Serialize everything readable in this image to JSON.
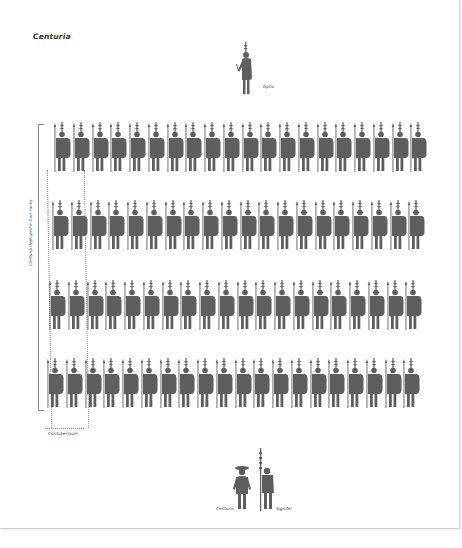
{
  "title": "Centuria",
  "colors": {
    "figure": "#5e5e5e",
    "line": "#888888",
    "text": "#333333"
  },
  "officers": {
    "optio": {
      "label": "Optio",
      "icon": "optio-soldier-icon"
    },
    "centurio": {
      "label": "Centurio",
      "icon": "centurion-icon"
    },
    "signifer": {
      "label": "Signifer",
      "icon": "signifer-standard-bearer-icon"
    }
  },
  "formation": {
    "ranks_label": "Centuria deployed in four ranks",
    "rank_count": 4,
    "soldiers_per_rank": 20,
    "soldier_icon": "legionary-soldier-icon",
    "ranks": [
      {
        "rank": 1,
        "soldiers": 20
      },
      {
        "rank": 2,
        "soldiers": 20
      },
      {
        "rank": 3,
        "soldiers": 20
      },
      {
        "rank": 4,
        "soldiers": 20
      }
    ]
  },
  "contubernium": {
    "label": "Contubernium",
    "columns": 2
  }
}
